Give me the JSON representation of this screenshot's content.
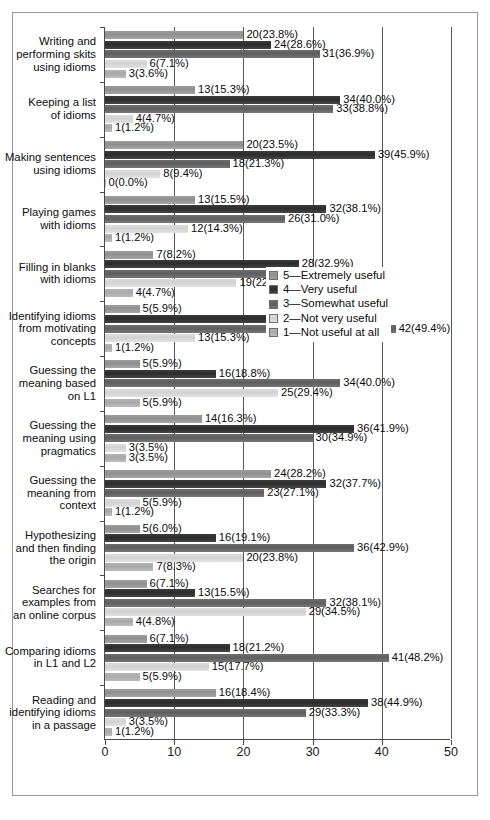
{
  "chart_data": {
    "type": "bar",
    "orientation": "horizontal",
    "grouped": true,
    "title": "",
    "subtitle": "",
    "xlabel": "",
    "ylabel": "",
    "xlim": [
      0,
      50
    ],
    "xticks": [
      0,
      10,
      20,
      30,
      40,
      50
    ],
    "xtick_labels": [
      "0",
      "10",
      "20",
      "30",
      "40",
      "50"
    ],
    "grid": true,
    "grid_axis": "x",
    "legend_position": "middle-right",
    "series_order_top_to_bottom": [
      "5",
      "4",
      "3",
      "2",
      "1"
    ],
    "legend": [
      {
        "key": "5",
        "name": "5—Extremely useful",
        "color": "#949494"
      },
      {
        "key": "4",
        "name": "4—Very useful",
        "color": "#333333"
      },
      {
        "key": "3",
        "name": "3—Somewhat useful",
        "color": "#666666"
      },
      {
        "key": "2",
        "name": "2—Not very useful",
        "color": "#d8d8d8"
      },
      {
        "key": "1",
        "name": "1—Not useful at all",
        "color": "#aeaeae"
      }
    ],
    "categories": [
      "Writing and performing skits using idioms",
      "Keeping a list of idioms",
      "Making sentences using idioms",
      "Playing games with idioms",
      "Filling in blanks with idioms",
      "Identifying idioms from motivating concepts",
      "Guessing the meaning based on L1",
      "Guessing the meaning using pragmatics",
      "Guessing the meaning from context",
      "Hypothesizing and then finding the origin",
      "Searches for examples from an online corpus",
      "Comparing idioms in L1 and L2",
      "Reading and identifying idioms in a passage"
    ],
    "category_lines": [
      [
        "Writing and",
        "performing skits",
        "using idioms"
      ],
      [
        "Keeping a list",
        "of idioms"
      ],
      [
        "Making sentences",
        "using idioms"
      ],
      [
        "Playing games",
        "with idioms"
      ],
      [
        "Filling in blanks",
        "with idioms"
      ],
      [
        "Identifying idioms",
        "from motivating",
        "concepts"
      ],
      [
        "Guessing the",
        "meaning based",
        "on L1"
      ],
      [
        "Guessing the",
        "meaning using",
        "pragmatics"
      ],
      [
        "Guessing the",
        "meaning from",
        "context"
      ],
      [
        "Hypothesizing",
        "and then finding",
        "the origin"
      ],
      [
        "Searches for",
        "examples from",
        "an online corpus"
      ],
      [
        "Comparing idioms",
        "in L1 and L2"
      ],
      [
        "Reading and",
        "identifying idioms",
        "in a passage"
      ]
    ],
    "series": [
      {
        "name": "5—Extremely useful",
        "key": "5",
        "values": [
          20,
          13,
          20,
          13,
          7,
          5,
          5,
          14,
          24,
          5,
          6,
          6,
          16
        ]
      },
      {
        "name": "4—Very useful",
        "key": "4",
        "values": [
          24,
          34,
          39,
          32,
          28,
          24,
          16,
          36,
          32,
          16,
          13,
          18,
          38
        ]
      },
      {
        "name": "3—Somewhat useful",
        "key": "3",
        "values": [
          31,
          33,
          18,
          26,
          27,
          42,
          34,
          30,
          23,
          36,
          32,
          41,
          29
        ]
      },
      {
        "name": "2—Not very useful",
        "key": "2",
        "values": [
          6,
          4,
          8,
          12,
          19,
          13,
          25,
          3,
          5,
          20,
          29,
          15,
          3
        ]
      },
      {
        "name": "1—Not useful at all",
        "key": "1",
        "values": [
          3,
          1,
          0,
          1,
          4,
          1,
          5,
          3,
          1,
          7,
          4,
          5,
          1
        ]
      }
    ],
    "data_labels": [
      {
        "category": "Writing and performing skits using idioms",
        "labels": [
          "20(23.8%)",
          "24(28.6%)",
          "31(36.9%)",
          "6(7.1%)",
          "3(3.6%)"
        ]
      },
      {
        "category": "Keeping a list of idioms",
        "labels": [
          "13(15.3%)",
          "34(40.0%)",
          "33(38.8%)",
          "4(4.7%)",
          "1(1.2%)"
        ]
      },
      {
        "category": "Making sentences using idioms",
        "labels": [
          "20(23.5%)",
          "39(45.9%)",
          "18(21.3%)",
          "8(9.4%)",
          "0(0.0%)"
        ]
      },
      {
        "category": "Playing games with idioms",
        "labels": [
          "13(15.5%)",
          "32(38.1%)",
          "26(31.0%)",
          "12(14.3%)",
          "1(1.2%)"
        ]
      },
      {
        "category": "Filling in blanks with idioms",
        "labels": [
          "7(8.2%)",
          "28(32.9%)",
          "27(31.8%)",
          "19(22.4%)",
          "4(4.7%)"
        ]
      },
      {
        "category": "Identifying idioms from motivating concepts",
        "labels": [
          "5(5.9%)",
          "24(28.2%)",
          "42(49.4%)",
          "13(15.3%)",
          "1(1.2%)"
        ]
      },
      {
        "category": "Guessing the meaning based on L1",
        "labels": [
          "5(5.9%)",
          "16(18.8%)",
          "34(40.0%)",
          "25(29.4%)",
          "5(5.9%)"
        ]
      },
      {
        "category": "Guessing the meaning using pragmatics",
        "labels": [
          "14(16.3%)",
          "36(41.9%)",
          "30(34.9%)",
          "3(3.5%)",
          "3(3.5%)"
        ]
      },
      {
        "category": "Guessing the meaning from context",
        "labels": [
          "24(28.2%)",
          "32(37.7%)",
          "23(27.1%)",
          "5(5.9%)",
          "1(1.2%)"
        ]
      },
      {
        "category": "Hypothesizing and then finding the origin",
        "labels": [
          "5(6.0%)",
          "16(19.1%)",
          "36(42.9%)",
          "20(23.8%)",
          "7(8.3%)"
        ]
      },
      {
        "category": "Searches for examples from an online corpus",
        "labels": [
          "6(7.1%)",
          "13(15.5%)",
          "32(38.1%)",
          "29(34.5%)",
          "4(4.8%)"
        ]
      },
      {
        "category": "Comparing idioms in L1 and L2",
        "labels": [
          "6(7.1%)",
          "18(21.2%)",
          "41(48.2%)",
          "15(17.7%)",
          "5(5.9%)"
        ]
      },
      {
        "category": "Reading and identifying idioms in a passage",
        "labels": [
          "16(18.4%)",
          "38(44.9%)",
          "29(33.3%)",
          "3(3.5%)",
          "1(1.2%)"
        ]
      }
    ]
  }
}
